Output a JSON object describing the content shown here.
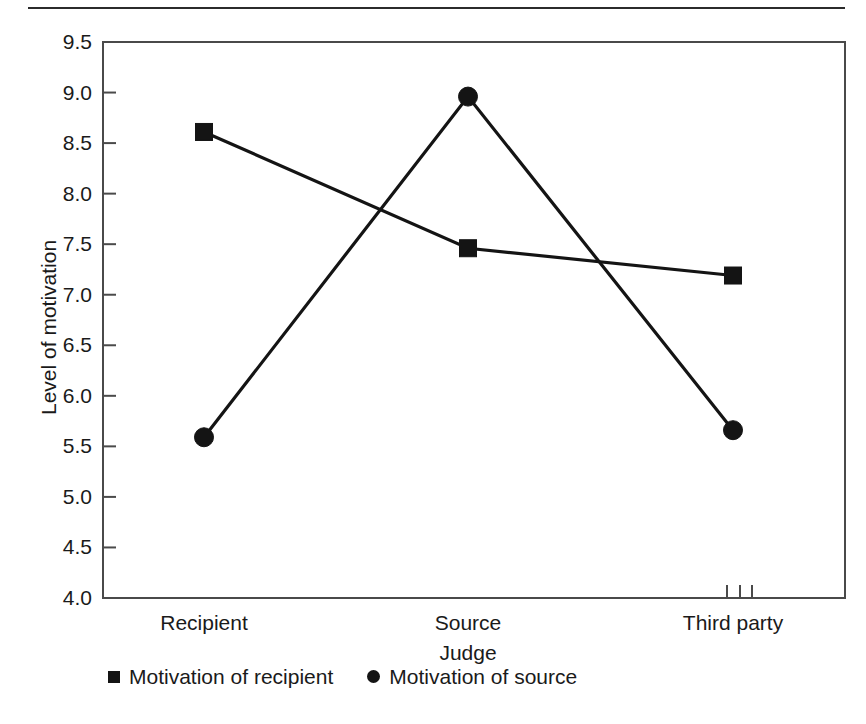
{
  "figure": {
    "background_color": "#ffffff",
    "ink_color": "#1a1a1a",
    "rule_color": "#2b2b2b"
  },
  "chart_data": {
    "type": "line",
    "title": "",
    "xlabel": "Judge",
    "ylabel": "Level of motivation",
    "categories": [
      "Recipient",
      "Source",
      "Third party"
    ],
    "ylim": [
      4.0,
      9.5
    ],
    "yticks": [
      "4.0",
      "4.5",
      "5.0",
      "5.5",
      "6.0",
      "6.5",
      "7.0",
      "7.5",
      "8.0",
      "8.5",
      "9.0",
      "9.5"
    ],
    "ytick_values": [
      4.0,
      4.5,
      5.0,
      5.5,
      6.0,
      6.5,
      7.0,
      7.5,
      8.0,
      8.5,
      9.0,
      9.5
    ],
    "grid": false,
    "legend_position": "below",
    "series": [
      {
        "name": "Motivation of recipient",
        "marker": "square",
        "color": "#141414",
        "values": [
          8.61,
          7.46,
          7.19
        ]
      },
      {
        "name": "Motivation of source",
        "marker": "circle",
        "color": "#141414",
        "values": [
          5.59,
          8.96,
          5.66
        ]
      }
    ],
    "annotations": [
      {
        "name": "axis-break-ticks",
        "description": "three short vertical tick marks on the x-axis baseline near the Third party category",
        "count": 3
      }
    ]
  },
  "legend": {
    "items": [
      {
        "label": "Motivation of recipient",
        "marker": "square"
      },
      {
        "label": "Motivation of source",
        "marker": "circle"
      }
    ]
  }
}
